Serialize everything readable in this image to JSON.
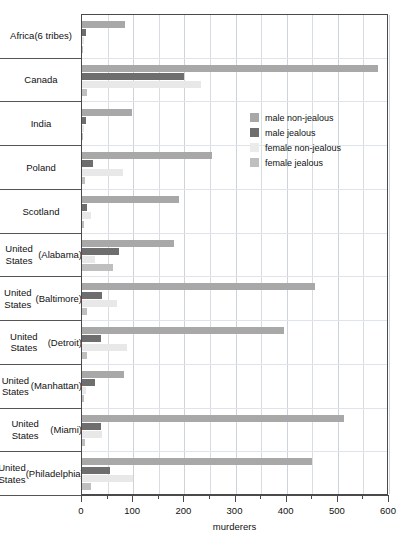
{
  "chart_data": {
    "type": "bar",
    "orientation": "horizontal",
    "title": "",
    "xlabel": "murderers",
    "ylabel": "",
    "xlim": [
      0,
      600
    ],
    "xticks": [
      0,
      100,
      200,
      300,
      400,
      500,
      600
    ],
    "xtick_labels": [
      "0",
      "100",
      "200",
      "300",
      "400",
      "500",
      "600"
    ],
    "minor_tick_step": 50,
    "grid": "vertical",
    "legend_position": "center-right",
    "categories": [
      "Africa\n(6 tribes)",
      "Canada",
      "India",
      "Poland",
      "Scotland",
      "United States\n(Alabama)",
      "United States\n(Baltimore)",
      "United States\n(Detroit)",
      "United States\n(Manhattan)",
      "United States\n(Miami)",
      "United States\n(Philadelphia)"
    ],
    "series": [
      {
        "name": "male non-jealous",
        "color": "#a8a8a8",
        "values": [
          85,
          578,
          98,
          255,
          190,
          180,
          455,
          395,
          82,
          512,
          450
        ]
      },
      {
        "name": "male jealous",
        "color": "#6e6e6e",
        "values": [
          8,
          200,
          8,
          22,
          10,
          72,
          40,
          38,
          25,
          38,
          55
        ]
      },
      {
        "name": "female non-jealous",
        "color": "#e8e8e8",
        "values": [
          3,
          232,
          3,
          80,
          18,
          25,
          68,
          88,
          8,
          40,
          100
        ]
      },
      {
        "name": "female jealous",
        "color": "#bfbfbf",
        "values": [
          2,
          10,
          2,
          6,
          4,
          60,
          10,
          10,
          3,
          6,
          18
        ]
      }
    ]
  },
  "legend": {
    "items": [
      {
        "label": "male non-jealous"
      },
      {
        "label": "male jealous"
      },
      {
        "label": "female non-jealous"
      },
      {
        "label": "female jealous"
      }
    ]
  },
  "axis": {
    "x_title": "murderers"
  }
}
